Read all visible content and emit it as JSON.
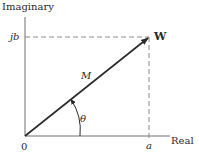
{
  "diagram": {
    "y_axis_label": "Imaginary",
    "x_axis_label": "Real",
    "origin_label": "0",
    "imag_component_label": "jb",
    "real_component_label": "a",
    "vector_label": "W",
    "magnitude_label": "M",
    "angle_label": "θ",
    "colors": {
      "axis": "#6e6e6e",
      "vector": "#2a2a2a",
      "dashed": "#8a8a8a",
      "text": "#2a2a2a"
    }
  }
}
